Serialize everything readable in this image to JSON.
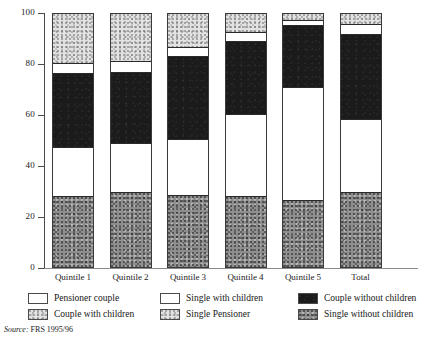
{
  "chart_data": {
    "type": "bar",
    "subtype": "stacked-percentage",
    "title": "",
    "xlabel": "",
    "ylabel": "",
    "ylim": [
      0,
      100
    ],
    "yticks": [
      0,
      20,
      40,
      60,
      80,
      100
    ],
    "grid": false,
    "legend_position": "bottom",
    "categories": [
      "Quintile 1",
      "Quintile 2",
      "Quintile 3",
      "Quintile 4",
      "Quintile 5",
      "Total"
    ],
    "stack_order_bottom_to_top": [
      "Single without children",
      "Pensioner couple",
      "Couple without children",
      "Single with children",
      "Couple with children"
    ],
    "series": [
      {
        "name": "Single without children",
        "fill": "midgray",
        "values": [
          28.2,
          29.5,
          28.5,
          28.0,
          26.5,
          29.5
        ]
      },
      {
        "name": "Pensioner couple",
        "fill": "white",
        "values": [
          19.3,
          19.5,
          22.0,
          32.5,
          44.5,
          29.0
        ]
      },
      {
        "name": "Couple without children",
        "fill": "black",
        "values": [
          29.0,
          28.0,
          33.0,
          29.0,
          24.5,
          33.5
        ]
      },
      {
        "name": "Single with children",
        "fill": "white",
        "values": [
          4.3,
          4.5,
          3.5,
          3.5,
          2.0,
          4.0
        ]
      },
      {
        "name": "Couple with children",
        "fill": "lightgray",
        "values": [
          19.2,
          18.5,
          13.0,
          7.0,
          2.5,
          4.0
        ]
      }
    ]
  },
  "axis": {
    "y_tick_labels": [
      "100",
      "80",
      "60",
      "40",
      "20",
      "0"
    ]
  },
  "legend": {
    "items": [
      {
        "label": "Pensioner couple",
        "fill": "white",
        "col": 0,
        "row": 0
      },
      {
        "label": "Couple with children",
        "fill": "lightgray",
        "col": 0,
        "row": 1
      },
      {
        "label": "Single with children",
        "fill": "white",
        "col": 1,
        "row": 0
      },
      {
        "label": "Single Pensioner",
        "fill": "lightgray",
        "col": 1,
        "row": 1
      },
      {
        "label": "Couple without children",
        "fill": "black",
        "col": 2,
        "row": 0
      },
      {
        "label": "Single without children",
        "fill": "midgray",
        "col": 2,
        "row": 1
      }
    ]
  },
  "source": {
    "prefix": "Source:",
    "text": "FRS 1995/96"
  },
  "colors": {
    "black": "#1b1b1b",
    "midgray": "#8e8e8e",
    "lightgray": "#e2e2e2",
    "white": "#ffffff",
    "axis": "#4a4a4a"
  }
}
